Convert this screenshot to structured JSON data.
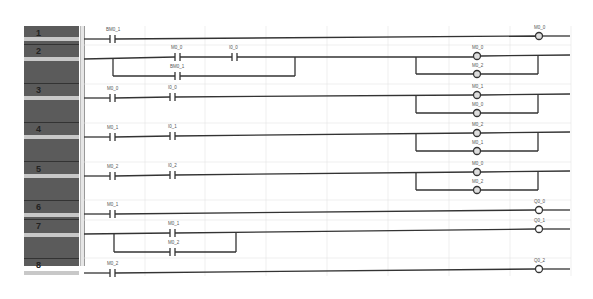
{
  "rungs": [
    {
      "num": "1",
      "contacts": [
        "BM0_1"
      ],
      "coils": [
        "M0_0"
      ]
    },
    {
      "num": "2",
      "contacts": [
        "M0_0",
        "I0_0",
        "BM0_1"
      ],
      "coils": [
        "M0_0",
        "M0_2"
      ]
    },
    {
      "num": "3",
      "contacts": [
        "M0_0",
        "I0_0"
      ],
      "coils": [
        "M0_1",
        "M0_0"
      ]
    },
    {
      "num": "4",
      "contacts": [
        "M0_1",
        "I0_1"
      ],
      "coils": [
        "M0_2",
        "M0_1"
      ]
    },
    {
      "num": "5",
      "contacts": [
        "M0_2",
        "I0_2"
      ],
      "coils": [
        "M0_0",
        "M0_2"
      ]
    },
    {
      "num": "6",
      "contacts": [
        "M0_1"
      ],
      "coils": [
        "Q0_0"
      ]
    },
    {
      "num": "7",
      "contacts": [
        "M0_1",
        "M0_2"
      ],
      "coils": [
        "Q0_1"
      ]
    },
    {
      "num": "8",
      "contacts": [
        "M0_2"
      ],
      "coils": [
        "Q0_2"
      ]
    }
  ],
  "colors": {
    "line": "#333333",
    "grid": "#e4e4e4",
    "num_col": "#5b5b5b",
    "bar": "#c8c8c8"
  }
}
